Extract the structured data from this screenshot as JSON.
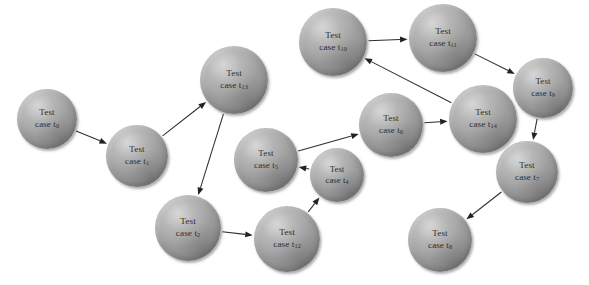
{
  "diagram": {
    "node_prefix": "Test",
    "node_label_word": "case",
    "node_fill_color": "#a6a6a6",
    "edge_color": "#2e2e2e",
    "background_color": "#ffffff"
  },
  "nodes": [
    {
      "id": "t0",
      "label_line1": "Test",
      "label_line2": "case t",
      "subscript": "0",
      "cx": 47,
      "cy": 119,
      "r": 30,
      "font_size": 9.0
    },
    {
      "id": "t1",
      "label_line1": "Test",
      "label_line2": "case t",
      "subscript": "1",
      "cx": 137,
      "cy": 156,
      "r": 31,
      "font_size": 9.0
    },
    {
      "id": "t13",
      "label_line1": "Test",
      "label_line2": "case t",
      "subscript": "13",
      "cx": 234,
      "cy": 80,
      "r": 34,
      "font_size": 9.2
    },
    {
      "id": "t2",
      "label_line1": "Test",
      "label_line2": "case t",
      "subscript": "2",
      "cx": 188,
      "cy": 228,
      "r": 33,
      "font_size": 9.2
    },
    {
      "id": "t12",
      "label_line1": "Test",
      "label_line2": "case t",
      "subscript": "12",
      "cx": 287,
      "cy": 239,
      "r": 33,
      "font_size": 9.2
    },
    {
      "id": "t4",
      "label_line1": "Test",
      "label_line2": "case t",
      "subscript": "4",
      "cx": 337,
      "cy": 175,
      "r": 27,
      "font_size": 8.7
    },
    {
      "id": "t5",
      "label_line1": "Test",
      "label_line2": "case t",
      "subscript": "5",
      "cx": 266,
      "cy": 160,
      "r": 32,
      "font_size": 9.0
    },
    {
      "id": "t6",
      "label_line1": "Test",
      "label_line2": "case t",
      "subscript": "6",
      "cx": 391,
      "cy": 125,
      "r": 32,
      "font_size": 9.0
    },
    {
      "id": "t14",
      "label_line1": "Test",
      "label_line2": "case t",
      "subscript": "14",
      "cx": 483,
      "cy": 119,
      "r": 34,
      "font_size": 9.2
    },
    {
      "id": "t10",
      "label_line1": "Test",
      "label_line2": "case t",
      "subscript": "10",
      "cx": 333,
      "cy": 42,
      "r": 34,
      "font_size": 9.2
    },
    {
      "id": "t11",
      "label_line1": "Test",
      "label_line2": "case t",
      "subscript": "11",
      "cx": 443,
      "cy": 38,
      "r": 34,
      "font_size": 9.2
    },
    {
      "id": "t9",
      "label_line1": "Test",
      "label_line2": "case t",
      "subscript": "9",
      "cx": 543,
      "cy": 88,
      "r": 30,
      "font_size": 8.9
    },
    {
      "id": "t7",
      "label_line1": "Test",
      "label_line2": "case t",
      "subscript": "7",
      "cx": 527,
      "cy": 172,
      "r": 31,
      "font_size": 9.0
    },
    {
      "id": "t8",
      "label_line1": "Test",
      "label_line2": "case t",
      "subscript": "8",
      "cx": 440,
      "cy": 240,
      "r": 32,
      "font_size": 9.0
    }
  ],
  "edges": [
    {
      "from": "t0",
      "to": "t1"
    },
    {
      "from": "t1",
      "to": "t13"
    },
    {
      "from": "t13",
      "to": "t2"
    },
    {
      "from": "t2",
      "to": "t12"
    },
    {
      "from": "t12",
      "to": "t4"
    },
    {
      "from": "t4",
      "to": "t5"
    },
    {
      "from": "t5",
      "to": "t6"
    },
    {
      "from": "t6",
      "to": "t14"
    },
    {
      "from": "t14",
      "to": "t10"
    },
    {
      "from": "t10",
      "to": "t11"
    },
    {
      "from": "t11",
      "to": "t9"
    },
    {
      "from": "t9",
      "to": "t7"
    },
    {
      "from": "t7",
      "to": "t8"
    }
  ]
}
